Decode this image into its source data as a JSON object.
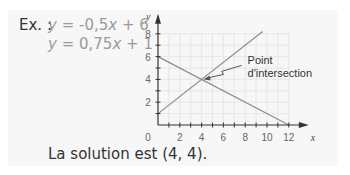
{
  "example": {
    "label": "Ex. :",
    "equation_1": {
      "lhs": "y",
      "rhs_a": " = -0,5",
      "var": "x",
      "rhs_b": " + 6"
    },
    "equation_2": {
      "lhs": "y",
      "rhs_a": " = 0,75",
      "var": "x",
      "rhs_b": " + 1"
    },
    "solution_text": "La solution est (4, 4)."
  },
  "colors": {
    "card_bg": "#f7f7f7",
    "line": "#8c8c8c",
    "grid": "#e2e2e2",
    "axis": "#333333"
  },
  "chart_data": {
    "type": "line",
    "title": "",
    "xlabel": "x",
    "ylabel": "y",
    "xlim": [
      0,
      12
    ],
    "ylim": [
      0,
      8
    ],
    "grid": true,
    "x_ticks": [
      "0",
      "2",
      "4",
      "6",
      "8",
      "10",
      "12"
    ],
    "y_ticks": [
      "2",
      "4",
      "6",
      "8"
    ],
    "series": [
      {
        "name": "y = -0,5x + 6",
        "x": [
          0,
          12
        ],
        "y": [
          6,
          0
        ]
      },
      {
        "name": "y = 0,75x + 1",
        "x": [
          0,
          9.6
        ],
        "y": [
          1,
          8.2
        ]
      }
    ],
    "annotations": [
      {
        "text_line1": "Point",
        "text_line2": "d'intersection",
        "x": 4,
        "y": 4
      }
    ]
  }
}
